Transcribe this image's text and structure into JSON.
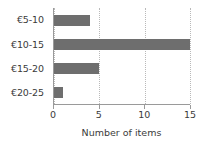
{
  "chart_data": {
    "type": "bar",
    "orientation": "horizontal",
    "title": "",
    "categories": [
      "€5-10",
      "€10-15",
      "€15-20",
      "€20-25"
    ],
    "values": [
      4,
      15,
      5,
      1
    ],
    "xlabel": "Number of items",
    "ylabel": "",
    "xlim": [
      0,
      15
    ],
    "xticks": [
      0,
      5,
      10,
      15
    ],
    "xticklabels": [
      "0",
      "5",
      "10",
      "15"
    ],
    "grid": "vertical-dotted",
    "legend": null,
    "colors": {
      "bar": "#6e6e6e",
      "axis": "#9a9a9a",
      "grid": "#b9b9b9",
      "text": "#3b3b3b",
      "background": "#ffffff"
    }
  }
}
